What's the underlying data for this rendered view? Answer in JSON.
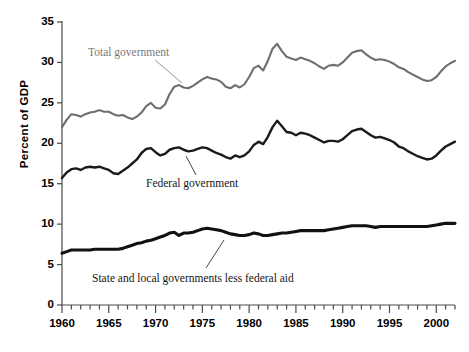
{
  "chart_data": {
    "type": "line",
    "title": "",
    "subtitle": "",
    "xlabel": "",
    "ylabel": "Percent of GDP",
    "xlim": [
      1960,
      2002
    ],
    "ylim": [
      0,
      35
    ],
    "y_ticks": [
      0,
      5,
      10,
      15,
      20,
      25,
      30,
      35
    ],
    "x_ticks_major": [
      1960,
      1965,
      1970,
      1975,
      1980,
      1985,
      1990,
      1995,
      2000
    ],
    "x_tick_labels": [
      "1960",
      "1965",
      "1970",
      "1975",
      "1980",
      "1985",
      "1990",
      "1995",
      "2000"
    ],
    "y_tick_labels": [
      "0",
      "5",
      "10",
      "15",
      "20",
      "25",
      "30",
      "35"
    ],
    "x_minor_tick_interval": 1,
    "grid": false,
    "legend": "annotations-inline",
    "x": [
      1960,
      1960.5,
      1961,
      1961.5,
      1962,
      1962.5,
      1963,
      1963.5,
      1964,
      1964.5,
      1965,
      1965.5,
      1966,
      1966.5,
      1967,
      1967.5,
      1968,
      1968.5,
      1969,
      1969.5,
      1970,
      1970.5,
      1971,
      1971.5,
      1972,
      1972.5,
      1973,
      1973.5,
      1974,
      1974.5,
      1975,
      1975.5,
      1976,
      1976.5,
      1977,
      1977.5,
      1978,
      1978.5,
      1979,
      1979.5,
      1980,
      1980.5,
      1981,
      1981.5,
      1982,
      1982.5,
      1983,
      1983.5,
      1984,
      1984.5,
      1985,
      1985.5,
      1986,
      1986.5,
      1987,
      1987.5,
      1988,
      1988.5,
      1989,
      1989.5,
      1990,
      1990.5,
      1991,
      1991.5,
      1992,
      1992.5,
      1993,
      1993.5,
      1994,
      1994.5,
      1995,
      1995.5,
      1996,
      1996.5,
      1997,
      1997.5,
      1998,
      1998.5,
      1999,
      1999.5,
      2000,
      2000.5,
      2001,
      2001.5,
      2002
    ],
    "series": [
      {
        "name": "Total government",
        "color": "#6e6e6e",
        "width": 2.1,
        "values": [
          22.0,
          22.9,
          23.6,
          23.5,
          23.3,
          23.6,
          23.8,
          23.9,
          24.1,
          23.9,
          23.9,
          23.6,
          23.4,
          23.5,
          23.2,
          23.0,
          23.3,
          23.8,
          24.6,
          25.0,
          24.4,
          24.3,
          24.8,
          26.1,
          27.0,
          27.2,
          26.9,
          26.8,
          27.1,
          27.5,
          27.9,
          28.2,
          28.0,
          27.9,
          27.6,
          27.0,
          26.8,
          27.2,
          26.9,
          27.3,
          28.2,
          29.3,
          29.6,
          29.0,
          30.2,
          31.7,
          32.3,
          31.4,
          30.7,
          30.5,
          30.3,
          30.6,
          30.4,
          30.2,
          29.9,
          29.5,
          29.2,
          29.6,
          29.7,
          29.6,
          30.0,
          30.6,
          31.2,
          31.4,
          31.5,
          31.0,
          30.6,
          30.3,
          30.4,
          30.3,
          30.1,
          29.8,
          29.4,
          29.2,
          28.8,
          28.5,
          28.2,
          27.9,
          27.7,
          27.8,
          28.2,
          28.9,
          29.5,
          29.9,
          30.2
        ]
      },
      {
        "name": "Federal government",
        "color": "#1a1a1a",
        "width": 2.4,
        "values": [
          15.7,
          16.4,
          16.8,
          16.9,
          16.7,
          17.0,
          17.1,
          17.0,
          17.1,
          16.9,
          16.7,
          16.3,
          16.2,
          16.6,
          17.0,
          17.5,
          18.0,
          18.8,
          19.3,
          19.4,
          18.9,
          18.5,
          18.7,
          19.2,
          19.4,
          19.5,
          19.2,
          19.0,
          19.1,
          19.3,
          19.5,
          19.4,
          19.1,
          18.8,
          18.6,
          18.3,
          18.1,
          18.5,
          18.3,
          18.5,
          19.0,
          19.8,
          20.2,
          19.9,
          20.8,
          22.0,
          22.8,
          22.1,
          21.4,
          21.3,
          21.0,
          21.3,
          21.2,
          21.0,
          20.7,
          20.4,
          20.1,
          20.3,
          20.3,
          20.2,
          20.5,
          21.0,
          21.5,
          21.7,
          21.8,
          21.4,
          21.0,
          20.7,
          20.8,
          20.6,
          20.4,
          20.1,
          19.6,
          19.4,
          19.0,
          18.7,
          18.4,
          18.2,
          18.0,
          18.1,
          18.5,
          19.1,
          19.6,
          19.9,
          20.2
        ]
      },
      {
        "name": "State and local governments less federal aid",
        "color": "#111111",
        "width": 3.1,
        "values": [
          6.4,
          6.6,
          6.8,
          6.8,
          6.8,
          6.8,
          6.8,
          6.9,
          6.9,
          6.9,
          6.9,
          6.9,
          6.9,
          7.0,
          7.2,
          7.4,
          7.6,
          7.7,
          7.9,
          8.0,
          8.2,
          8.4,
          8.6,
          8.9,
          9.0,
          8.6,
          8.9,
          8.9,
          9.0,
          9.2,
          9.4,
          9.5,
          9.4,
          9.3,
          9.2,
          9.0,
          8.8,
          8.7,
          8.6,
          8.6,
          8.7,
          8.9,
          8.8,
          8.6,
          8.6,
          8.7,
          8.8,
          8.9,
          8.9,
          9.0,
          9.1,
          9.2,
          9.2,
          9.2,
          9.2,
          9.2,
          9.2,
          9.3,
          9.4,
          9.5,
          9.6,
          9.7,
          9.8,
          9.8,
          9.8,
          9.8,
          9.7,
          9.6,
          9.7,
          9.7,
          9.7,
          9.7,
          9.7,
          9.7,
          9.7,
          9.7,
          9.7,
          9.7,
          9.7,
          9.8,
          9.9,
          10.0,
          10.1,
          10.1,
          10.1
        ]
      }
    ],
    "annotations": [
      {
        "text": "Total government",
        "color": "#7a7a7a",
        "label_x": 88,
        "label_y": 46,
        "leader": [
          155,
          60,
          182,
          83
        ]
      },
      {
        "text": "Federal government",
        "color": "#151515",
        "label_x": 146,
        "label_y": 177,
        "leader": [
          196,
          175,
          186,
          156
        ]
      },
      {
        "text": "State and local governments less federal aid",
        "color": "#151515",
        "label_x": 92,
        "label_y": 272,
        "leader": [
          206,
          268,
          224,
          240
        ]
      }
    ]
  },
  "axis": {
    "ylabel_text": "Percent of GDP",
    "axis_color": "#4a4a4a"
  }
}
